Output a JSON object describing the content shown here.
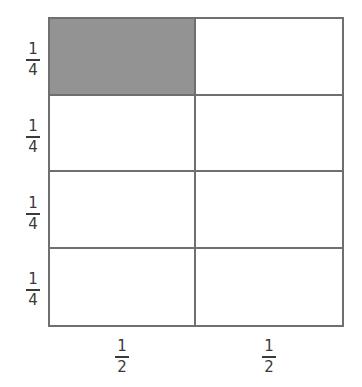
{
  "diagram": {
    "title": "",
    "shaded_color": "#939393",
    "line_color": "#6f6f6f",
    "rows": 4,
    "columns": 2,
    "shaded_cells": [
      [
        0,
        0
      ]
    ],
    "row_labels": [
      {
        "numerator": "1",
        "denominator": "4"
      },
      {
        "numerator": "1",
        "denominator": "4"
      },
      {
        "numerator": "1",
        "denominator": "4"
      },
      {
        "numerator": "1",
        "denominator": "4"
      }
    ],
    "column_labels": [
      {
        "numerator": "1",
        "denominator": "2"
      },
      {
        "numerator": "1",
        "denominator": "2"
      }
    ]
  }
}
